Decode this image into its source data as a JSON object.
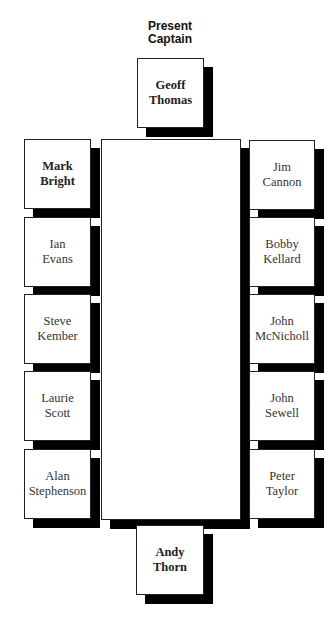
{
  "title": "Present Captain",
  "title_lines": [
    "Present",
    "Captain"
  ],
  "head": {
    "name": "Geoff Thomas",
    "lines": [
      "Geoff",
      "Thomas"
    ],
    "bold": true
  },
  "foot": {
    "name": "Andy Thorn",
    "lines": [
      "Andy",
      "Thorn"
    ],
    "bold": true
  },
  "left": [
    {
      "name": "Mark Bright",
      "lines": [
        "Mark",
        "Bright"
      ],
      "bold": true
    },
    {
      "name": "Ian Evans",
      "lines": [
        "Ian",
        "Evans"
      ],
      "bold": false
    },
    {
      "name": "Steve Kember",
      "lines": [
        "Steve",
        "Kember"
      ],
      "bold": false
    },
    {
      "name": "Laurie Scott",
      "lines": [
        "Laurie",
        "Scott"
      ],
      "bold": false
    },
    {
      "name": "Alan Stephenson",
      "lines": [
        "Alan",
        "Stephenson"
      ],
      "bold": false
    }
  ],
  "right": [
    {
      "name": "Jim Cannon",
      "lines": [
        "Jim",
        "Cannon"
      ],
      "bold": false
    },
    {
      "name": "Bobby Kellard",
      "lines": [
        "Bobby",
        "Kellard"
      ],
      "bold": false
    },
    {
      "name": "John McNicholl",
      "lines": [
        "John",
        "McNicholl"
      ],
      "bold": false
    },
    {
      "name": "John Sewell",
      "lines": [
        "John",
        "Sewell"
      ],
      "bold": false
    },
    {
      "name": "Peter Taylor",
      "lines": [
        "Peter",
        "Taylor"
      ],
      "bold": false
    }
  ]
}
